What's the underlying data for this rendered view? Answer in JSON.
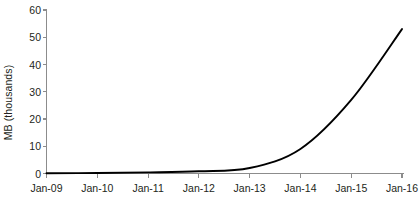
{
  "chart_data": {
    "type": "line",
    "title": "",
    "subtitle": "",
    "xlabel": "",
    "ylabel": "MB (thousands)",
    "grid": false,
    "legend": false,
    "legend_position": "none",
    "categories": [
      "Jan-09",
      "Jan-10",
      "Jan-11",
      "Jan-12",
      "Jan-13",
      "Jan-14",
      "Jan-15",
      "Jan-16"
    ],
    "x_tick_labels": [
      "Jan-09",
      "Jan-10",
      "Jan-11",
      "Jan-12",
      "Jan-13",
      "Jan-14",
      "Jan-15",
      "Jan-16"
    ],
    "y_tick_labels": [
      "0",
      "10",
      "20",
      "30",
      "40",
      "50",
      "60"
    ],
    "y_tick_values": [
      0,
      10,
      20,
      30,
      40,
      50,
      60
    ],
    "ylim": [
      0,
      60
    ],
    "xlim": [
      "Jan-09",
      "Jan-16"
    ],
    "series": [
      {
        "name": "MB (thousands)",
        "color": "#000000",
        "values": [
          0.1,
          0.2,
          0.4,
          0.8,
          2.0,
          9.0,
          27.0,
          53.0
        ]
      }
    ],
    "annotations": []
  },
  "axes": {
    "axis_color": "#8c8c8c",
    "tick_color": "#8c8c8c",
    "label_color": "#231f20"
  },
  "y_axis": {
    "title": "MB (thousands)"
  }
}
